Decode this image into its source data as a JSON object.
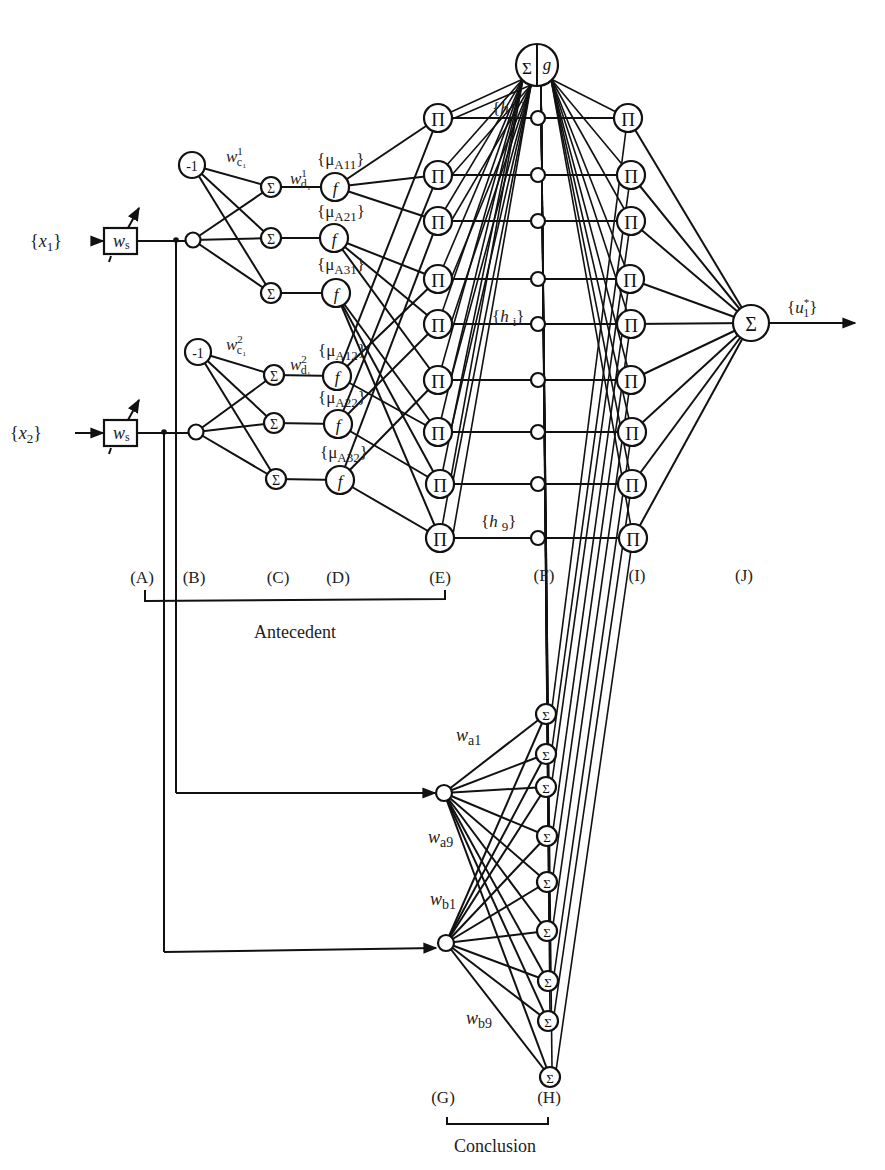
{
  "diagram": {
    "inputs": [
      {
        "label": "{x₁}",
        "var": "x",
        "sub": "1",
        "x": 65,
        "y": 240
      },
      {
        "label": "{x₂}",
        "var": "x",
        "sub": "2",
        "x": 45,
        "y": 432
      }
    ],
    "weight_box": {
      "label": "w",
      "sub": "s"
    },
    "layer_labels": {
      "A": "(A)",
      "B": "(B)",
      "C": "(C)",
      "D": "(D)",
      "E": "(E)",
      "F": "(F)",
      "I": "(I)",
      "J": "(J)",
      "G": "(G)",
      "H": "(H)"
    },
    "groups": {
      "antecedent": "Antecedent",
      "conclusion": "Conclusion"
    },
    "bias_label": "-1",
    "weights": {
      "wc1": {
        "main": "w",
        "sub": "c₁",
        "sup": "1"
      },
      "wc2": {
        "main": "w",
        "sub": "c₁",
        "sup": "2"
      },
      "wd1": {
        "main": "w",
        "sub": "d₁",
        "sup": "1"
      },
      "wd2": {
        "main": "w",
        "sub": "d₁",
        "sup": "2"
      },
      "wa1": {
        "main": "w",
        "sub": "a1"
      },
      "wa9": {
        "main": "w",
        "sub": "a9"
      },
      "wb1": {
        "main": "w",
        "sub": "b1"
      },
      "wb9": {
        "main": "w",
        "sub": "b9"
      }
    },
    "membership_labels": [
      "{μA11}",
      "{μA21}",
      "{μA31}",
      "{μA12}",
      "{μA22}",
      "{μA32}"
    ],
    "membership_parts": [
      {
        "pre": "{μ",
        "sub": "A11",
        "post": "}"
      },
      {
        "pre": "{μ",
        "sub": "A21",
        "post": "}"
      },
      {
        "pre": "{μ",
        "sub": "A31",
        "post": "}"
      },
      {
        "pre": "{μ",
        "sub": "A12",
        "post": "}"
      },
      {
        "pre": "{μ",
        "sub": "A22",
        "post": "}"
      },
      {
        "pre": "{μ",
        "sub": "A32",
        "post": "}"
      }
    ],
    "hidden_labels": {
      "h1": {
        "pre": "{h",
        "sub": "1",
        "post": "}"
      },
      "hi": {
        "pre": "{h",
        "sub": "i",
        "post": "}"
      },
      "h9": {
        "pre": "{h",
        "sub": "9",
        "post": "}"
      }
    },
    "node_symbols": {
      "sum": "Σ",
      "product": "Π",
      "function": "f",
      "g": "g"
    },
    "output": {
      "label": "{u₁*}",
      "var": "u",
      "sub": "1",
      "sup": "*"
    },
    "rule_count": 9
  }
}
